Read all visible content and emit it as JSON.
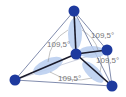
{
  "diagram": {
    "type": "tetrahedral-molecule",
    "angle_labels": [
      {
        "text": "109,5°",
        "x": 47,
        "y": 47
      },
      {
        "text": "109,5°",
        "x": 91,
        "y": 38
      },
      {
        "text": "109,5°",
        "x": 96,
        "y": 63
      },
      {
        "text": "109,5°",
        "x": 58,
        "y": 81
      }
    ],
    "colors": {
      "atom": "#1e3a9e",
      "orbital": "#b8cdef",
      "bond": "#1a1a2a",
      "edge": "#4a5a8a",
      "label": "#777777"
    }
  }
}
